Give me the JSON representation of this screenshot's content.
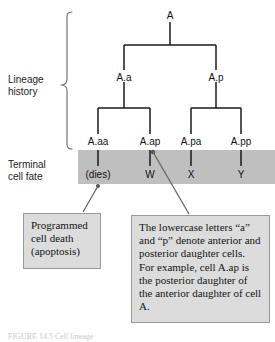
{
  "figure": {
    "background_color": "#ffffff",
    "line_color": "#1a1a1a",
    "band_color": "#bfbfbf",
    "callout_fill": "#dcdcdc",
    "callout_border": "#9a9a9a"
  },
  "sections": {
    "lineage_label": "Lineage\nhistory",
    "terminal_label": "Terminal\ncell fate"
  },
  "tree": {
    "root": {
      "label": "A",
      "x": 170,
      "y": 16
    },
    "generation2": [
      {
        "label": "A.a",
        "x": 124,
        "y": 78
      },
      {
        "label": "A.p",
        "x": 216,
        "y": 78
      }
    ],
    "generation3": [
      {
        "label": "A.aa",
        "x": 98,
        "y": 142
      },
      {
        "label": "A.ap",
        "x": 150,
        "y": 142
      },
      {
        "label": "A.pa",
        "x": 191,
        "y": 142
      },
      {
        "label": "A.pp",
        "x": 241,
        "y": 142
      }
    ]
  },
  "terminal_fates": [
    {
      "label": "(dies)",
      "x": 98,
      "y": 175,
      "parent": "A.aa"
    },
    {
      "label": "W",
      "x": 150,
      "y": 175,
      "parent": "A.ap"
    },
    {
      "label": "X",
      "x": 191,
      "y": 175,
      "parent": "A.pa"
    },
    {
      "label": "Y",
      "x": 241,
      "y": 175,
      "parent": "A.pp"
    }
  ],
  "callouts": {
    "apoptosis": "Programmed cell death (apoptosis)",
    "nomenclature": "The lowercase letters “a” and “p” denote anterior and posterior daughter cells. For example, cell A.ap is the posterior daughter of the anterior daughter of cell A."
  },
  "caption_fragment": "FIGURE 14.5  Cell lineage"
}
